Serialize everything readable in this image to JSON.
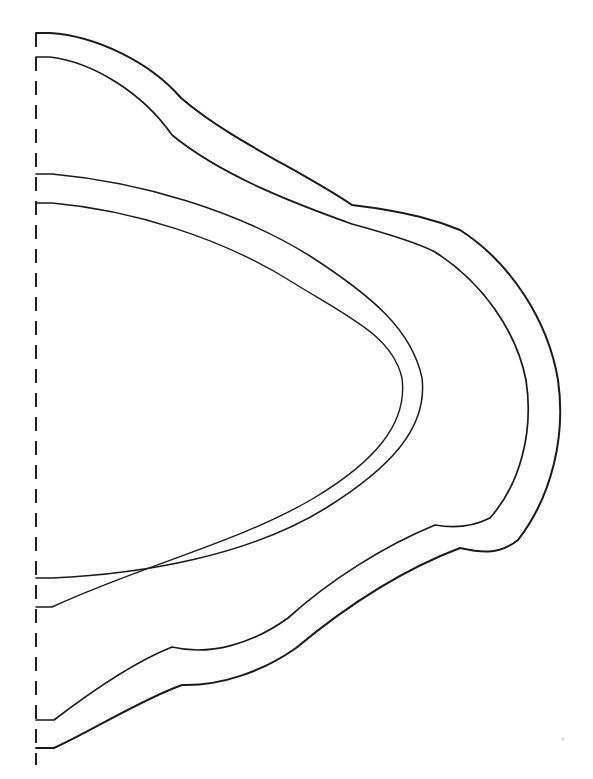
{
  "document": {
    "kind": "line-drawing",
    "subtitle": "Half pattern template, mirrored about vertical fold line",
    "background_color": "#ffffff",
    "ink_color": "#1a1a1a",
    "width": 593,
    "height": 779
  },
  "fold_line": {
    "name": "fold line",
    "style": "dashed",
    "orientation": "vertical",
    "x": 36,
    "y_start": 33,
    "y_end": 765,
    "dash_pattern": "14 10",
    "stroke_width": 2.0,
    "color": "#202020"
  },
  "shapes": {
    "outer_band_outer_edge": {
      "label": "outer scalloped edge",
      "stroke_width": 2.0,
      "start_point": [
        36,
        33
      ],
      "end_point": [
        36,
        748
      ],
      "cusps": [
        [
          181,
          98
        ],
        [
          460,
          230
        ],
        [
          460,
          548
        ],
        [
          182,
          685
        ]
      ],
      "extreme_right_x": 562,
      "path": "M 36 33 L 50 33 C 96 36 150 62 181 98 C 230 140 300 170 352 205 C 410 212 438 221 460 230 C 510 262 548 320 558 380 C 566 436 552 496 518 540 C 498 556 478 552 460 548 C 402 570 344 608 296 648 C 262 672 220 686 182 685 C 140 700 90 732 54 748 L 36 748"
    },
    "outer_band_inner_edge": {
      "label": "outer scalloped inner edge",
      "stroke_width": 1.7,
      "start_point": [
        36,
        57
      ],
      "end_point": [
        36,
        720
      ],
      "cusps": [
        [
          172,
          135
        ],
        [
          435,
          252
        ],
        [
          435,
          525
        ],
        [
          172,
          647
        ]
      ],
      "extreme_right_x": 532,
      "path": "M 36 57 L 50 57 C 92 62 142 92 172 135 C 222 176 296 204 352 224 C 396 236 420 244 435 252 C 482 282 516 330 526 380 C 534 432 520 484 490 518 C 470 528 452 528 435 525 C 384 546 330 580 288 618 C 252 644 210 656 172 647 C 134 662 88 694 54 720 L 36 720"
    },
    "inner_oval_outer_edge": {
      "label": "inner arch outer edge",
      "stroke_width": 1.5,
      "start_point": [
        36,
        174
      ],
      "end_point": [
        36,
        578
      ],
      "extreme_right_x": 425,
      "path": "M 36 174 L 52 174 C 140 182 236 210 310 256 C 372 296 412 330 422 378 C 428 428 390 468 326 508 C 248 556 142 574 52 578 L 36 578"
    },
    "inner_oval_inner_edge": {
      "label": "inner arch inner edge",
      "stroke_width": 1.4,
      "start_point": [
        36,
        203
      ],
      "end_point": [
        36,
        607
      ],
      "extreme_right_x": 405,
      "path": "M 36 203 L 52 203 C 132 210 222 238 292 282 C 350 318 392 336 402 378 C 408 424 374 462 314 498 C 240 542 140 566 52 607 L 36 607"
    }
  },
  "marks": [
    {
      "name": "paper-speck",
      "x": 563,
      "y": 739,
      "r": 1.6
    }
  ]
}
